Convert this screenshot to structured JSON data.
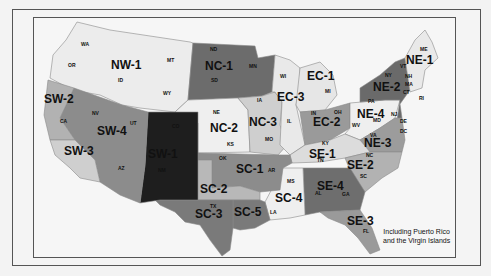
{
  "map": {
    "title": "",
    "note_line1": "Including Puerto Rico",
    "note_line2": "and the Virgin Islands",
    "colors": {
      "lightest": "#ededed",
      "light": "#d6d6d6",
      "mid_light": "#b9b9b9",
      "mid": "#969696",
      "dark": "#6e6e6e",
      "darkest": "#1e1e1e"
    },
    "regions": [
      {
        "id": "NW-1",
        "label": "NW-1",
        "states": [
          "WA",
          "OR",
          "ID",
          "MT",
          "WY"
        ]
      },
      {
        "id": "NC-1",
        "label": "NC-1",
        "states": [
          "ND",
          "SD",
          "MN"
        ]
      },
      {
        "id": "NC-2",
        "label": "NC-2",
        "states": [
          "NE",
          "KS"
        ]
      },
      {
        "id": "NC-3",
        "label": "NC-3",
        "states": [
          "IA",
          "MO"
        ]
      },
      {
        "id": "SW-1",
        "label": "SW-1",
        "states": [
          "CO",
          "NM"
        ]
      },
      {
        "id": "SW-2",
        "label": "SW-2",
        "states": [
          "CA (north)"
        ]
      },
      {
        "id": "SW-3",
        "label": "SW-3",
        "states": [
          "CA (south)"
        ]
      },
      {
        "id": "SW-4",
        "label": "SW-4",
        "states": [
          "NV",
          "UT",
          "AZ"
        ]
      },
      {
        "id": "SC-1",
        "label": "SC-1",
        "states": [
          "OK",
          "AR"
        ]
      },
      {
        "id": "SC-2",
        "label": "SC-2",
        "states": [
          "TX (north)"
        ]
      },
      {
        "id": "SC-3",
        "label": "SC-3",
        "states": [
          "TX"
        ]
      },
      {
        "id": "SC-4",
        "label": "SC-4",
        "states": [
          "MS",
          "LA"
        ]
      },
      {
        "id": "SC-5",
        "label": "SC-5",
        "states": [
          "TX (east)"
        ]
      },
      {
        "id": "EC-1",
        "label": "EC-1",
        "states": [
          "MI"
        ]
      },
      {
        "id": "EC-2",
        "label": "EC-2",
        "states": [
          "IN",
          "OH"
        ]
      },
      {
        "id": "EC-3",
        "label": "EC-3",
        "states": [
          "WI",
          "IL"
        ]
      },
      {
        "id": "SE-1",
        "label": "SE-1",
        "states": [
          "KY",
          "TN"
        ]
      },
      {
        "id": "SE-2",
        "label": "SE-2",
        "states": [
          "NC",
          "SC"
        ]
      },
      {
        "id": "SE-3",
        "label": "SE-3",
        "states": [
          "FL"
        ]
      },
      {
        "id": "SE-4",
        "label": "SE-4",
        "states": [
          "AL",
          "GA"
        ]
      },
      {
        "id": "NE-1",
        "label": "NE-1",
        "states": [
          "ME",
          "VT",
          "NH",
          "MA",
          "CT",
          "RI"
        ]
      },
      {
        "id": "NE-2",
        "label": "NE-2",
        "states": [
          "NY",
          "NJ"
        ]
      },
      {
        "id": "NE-3",
        "label": "NE-3",
        "states": [
          "VA",
          "MD",
          "DE",
          "DC"
        ]
      },
      {
        "id": "NE-4",
        "label": "NE-4",
        "states": [
          "PA",
          "WV"
        ]
      }
    ],
    "state_labels": {
      "WA": "WA",
      "OR": "OR",
      "ID": "ID",
      "MT": "MT",
      "WY": "WY",
      "ND": "ND",
      "SD": "SD",
      "MN": "MN",
      "NE": "NE",
      "KS": "KS",
      "IA": "IA",
      "MO": "MO",
      "NV": "NV",
      "UT": "UT",
      "CA": "CA",
      "AZ": "AZ",
      "CO": "CO",
      "NM": "NM",
      "OK": "OK",
      "TX": "TX",
      "AR": "AR",
      "LA": "LA",
      "MS": "MS",
      "WI": "WI",
      "IL": "IL",
      "MI": "MI",
      "IN": "IN",
      "OH": "OH",
      "KY": "KY",
      "TN": "TN",
      "AL": "AL",
      "GA": "GA",
      "FL": "FL",
      "SC": "SC",
      "NC": "NC",
      "VA": "VA",
      "WV": "WV",
      "MD": "MD",
      "DE": "DE",
      "DC": "DC",
      "PA": "PA",
      "NJ": "NJ",
      "NY": "NY",
      "VT": "VT",
      "NH": "NH",
      "MA": "MA",
      "CT": "CT",
      "RI": "RI",
      "ME": "ME"
    }
  }
}
